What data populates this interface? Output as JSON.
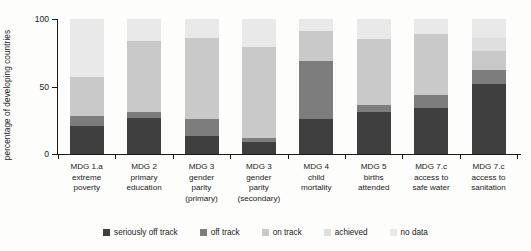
{
  "chart_data": {
    "type": "bar",
    "subtype": "stacked-bar-100",
    "title": "",
    "xlabel": "",
    "ylabel": "percentage of developing countries",
    "ylim": [
      0,
      100
    ],
    "yticks": [
      0,
      50,
      100
    ],
    "ytick_labels": [
      "0",
      "50",
      "100"
    ],
    "grid": false,
    "legend_position": "bottom",
    "categories": [
      "MDG 1.a extreme poverty",
      "MDG 2 primary education",
      "MDG 3 gender parity (primary)",
      "MDG 3 gender parity (secondary)",
      "MDG 4 child mortality",
      "MDG 5 births attended",
      "MDG 7.c access to safe water",
      "MDG 7.c access to sanitation"
    ],
    "category_lines": [
      [
        "MDG 1.a",
        "extreme",
        "poverty"
      ],
      [
        "MDG 2",
        "primary",
        "education"
      ],
      [
        "MDG 3",
        "gender",
        "parity",
        "(primary)"
      ],
      [
        "MDG 3",
        "gender",
        "parity",
        "(secondary)"
      ],
      [
        "MDG 4",
        "child",
        "mortality"
      ],
      [
        "MDG 5",
        "births",
        "attended"
      ],
      [
        "MDG 7.c",
        "access to",
        "safe water"
      ],
      [
        "MDG 7.c",
        "access to",
        "sanitation"
      ]
    ],
    "series": [
      {
        "name": "seriously off track",
        "color": "#3f3f3f",
        "values": [
          21,
          27,
          13,
          9,
          26,
          31,
          34,
          52
        ]
      },
      {
        "name": "off track",
        "color": "#7d7d7d",
        "values": [
          7,
          4,
          13,
          3,
          43,
          5,
          10,
          10
        ]
      },
      {
        "name": "on track",
        "color": "#c9c9c9",
        "values": [
          29,
          53,
          60,
          67,
          22,
          49,
          45,
          14
        ]
      },
      {
        "name": "achieved",
        "color": "#dedede",
        "values": [
          0,
          0,
          0,
          0,
          0,
          0,
          0,
          10
        ]
      },
      {
        "name": "no data",
        "color": "#e9e9e9",
        "values": [
          43,
          16,
          14,
          21,
          9,
          15,
          11,
          14
        ]
      }
    ]
  }
}
